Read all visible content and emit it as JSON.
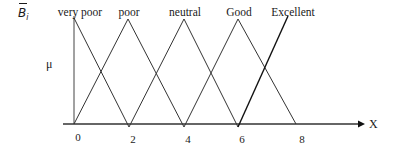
{
  "figure": {
    "symbol": "B",
    "symbol_subscript": "i",
    "y_axis_label": "μ",
    "x_axis_label": "X",
    "x_ticks": [
      "0",
      "2",
      "4",
      "6",
      "8"
    ],
    "fuzzy_sets": [
      {
        "label": "very poor"
      },
      {
        "label": "poor"
      },
      {
        "label": "neutral"
      },
      {
        "label": "Good"
      },
      {
        "label": "Excellent"
      }
    ],
    "colors": {
      "line": "#1a1a1a",
      "background": "#ffffff"
    }
  }
}
